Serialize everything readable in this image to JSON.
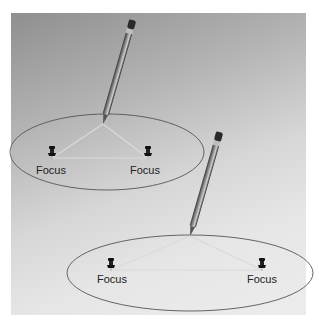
{
  "diagram": {
    "panels": [
      {
        "name": "narrow-ellipse",
        "ellipse": {
          "cx": 107,
          "cy": 152,
          "rx": 97,
          "ry": 38
        },
        "foci": [
          {
            "label": "Focus",
            "x": 52,
            "y": 155
          },
          {
            "label": "Focus",
            "x": 148,
            "y": 155
          }
        ],
        "pencil_tip": {
          "x": 103,
          "y": 124
        }
      },
      {
        "name": "wide-ellipse",
        "ellipse": {
          "cx": 190,
          "cy": 273,
          "rx": 123,
          "ry": 38
        },
        "foci": [
          {
            "label": "Focus",
            "x": 111,
            "y": 270
          },
          {
            "label": "Focus",
            "x": 262,
            "y": 270
          }
        ],
        "pencil_tip": {
          "x": 190,
          "y": 236
        }
      }
    ]
  },
  "colors": {
    "panel_dark": "#8f8f8f",
    "panel_light": "#ececec",
    "ellipse_stroke": "#555555",
    "string": "#d8d8d8",
    "pin": "#1a1a1a"
  }
}
